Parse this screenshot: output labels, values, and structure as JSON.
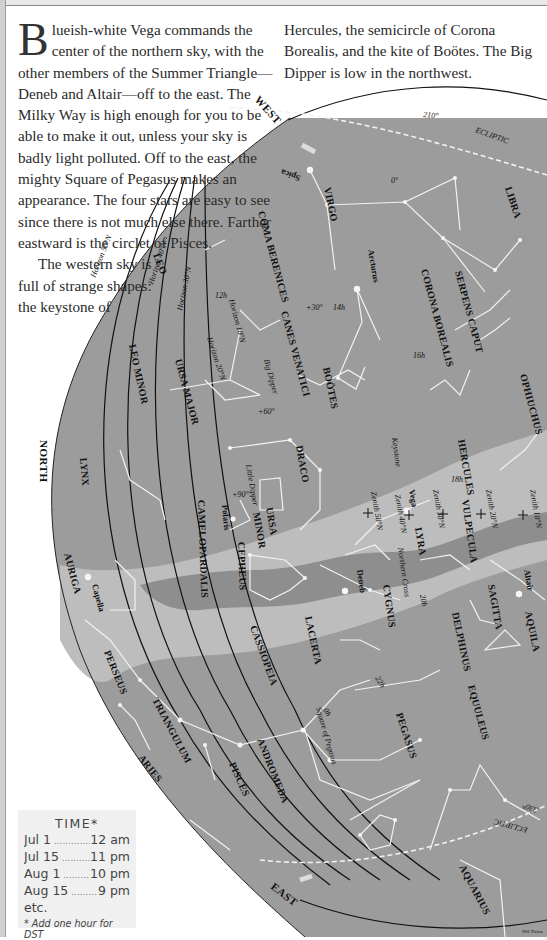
{
  "text": {
    "drop_cap": "B",
    "para1_rest": "lueish-white Vega commands the center of the northern sky, with the other members of the Summer Triangle—Deneb and Altair—off to the east. The Milky Way is high enough for you to be able to make it out, unless your sky is badly light polluted. Off to the east, the mighty Square of Pegasus makes an appearance. The four stars are easy to see since there is not much else there. Farther eastward is the circlet of Pisces.",
    "para2_left": "The western sky is full of strange shapes: the keystone of",
    "para2_right": "Hercules, the semicircle of Corona Borealis, and the kite of Boötes. The Big Dipper is low in the northwest."
  },
  "time_box": {
    "title": "TIME*",
    "rows": [
      {
        "date": "Jul 1",
        "time": "12 am"
      },
      {
        "date": "Jul 15",
        "time": "11 pm"
      },
      {
        "date": "Aug 1",
        "time": "10 pm"
      },
      {
        "date": "Aug 15",
        "time": "9 pm"
      }
    ],
    "etc": "etc.",
    "note": "* Add one hour for DST"
  },
  "directions": {
    "west": "WEST",
    "north": "NORTH",
    "east": "EAST"
  },
  "constellations": {
    "virgo": "VIRGO",
    "libra": "LIBRA",
    "coma": "COMA BERENICES",
    "canes": "CANES VENATICI",
    "bootes": "BOÖTES",
    "corona": "CORONA BOREALIS",
    "serpens": "SERPENS CAPUT",
    "ophiuchus": "OPHIUCHUS",
    "hercules": "HERCULES",
    "draco": "DRACO",
    "ursa_minor_1": "URSA",
    "ursa_minor_2": "MINOR",
    "ursa_major": "URSA MAJOR",
    "leo": "LEO",
    "leo_minor": "LEO MINOR",
    "lynx": "LYNX",
    "camelopardalis": "CAMELOPARDALIS",
    "cepheus": "CEPHEUS",
    "lyra": "LYRA",
    "vulpecula": "VULPECULA",
    "cygnus": "CYGNUS",
    "sagitta": "SAGITTA",
    "aquila": "AQUILA",
    "delphinus": "DELPHINUS",
    "equuleus": "EQUULEUS",
    "lacerta": "LACERTA",
    "cassiopeia": "CASSIOPEIA",
    "pegasus": "PEGASUS",
    "andromeda": "ANDROMEDA",
    "pisces": "PISCES",
    "triangulum": "TRIANGULUM",
    "aries": "ARIES",
    "perseus": "PERSEUS",
    "auriga": "AURIGA",
    "aquarius": "AQUARIUS"
  },
  "stars": {
    "spica": "Spica",
    "arcturus": "Arcturus",
    "vega": "Vega",
    "deneb": "Deneb",
    "altair": "Altair",
    "capella": "Capella",
    "polaris": "Polaris"
  },
  "asterisms": {
    "big_dipper": "Big Dipper",
    "little_dipper": "Little Dipper",
    "keystone": "Keystone",
    "northern_cross": "Northern Cross",
    "square_pegasus": "Square of Pegasus"
  },
  "horizons": {
    "h50": "Horizon 50°N",
    "h40": "Horizon 40°N",
    "h30": "Horizon 30°N",
    "h20": "Horizon 20°N",
    "h10": "Horizon 10°N"
  },
  "zeniths": {
    "z50": "Zenith 50°N",
    "z40": "Zenith 40°N",
    "z30": "Zenith 30°N",
    "z20": "Zenith 20°N",
    "z10": "Zenith 10°N"
  },
  "ecliptic": {
    "label": "ECLIPTIC",
    "label2": "ECLIPTIC",
    "deg_210": "210°",
    "deg_330": "330°"
  },
  "grid": {
    "ra_12": "12h",
    "ra_14": "14h",
    "ra_16": "16h",
    "ra_18": "18h",
    "ra_20": "20h",
    "ra_22": "22h",
    "ra_0": "0h",
    "dec_0": "0°",
    "dec_30": "+30°",
    "dec_60": "+60°",
    "dec_90": "+90°"
  },
  "credit": "Wil Tirion",
  "colors": {
    "sky": "#9c9c9c",
    "milky_way": "#bdbdbd",
    "milky_dark": "#8e8e8e",
    "lines": "#f2f2f2",
    "horizon": "#111111"
  }
}
